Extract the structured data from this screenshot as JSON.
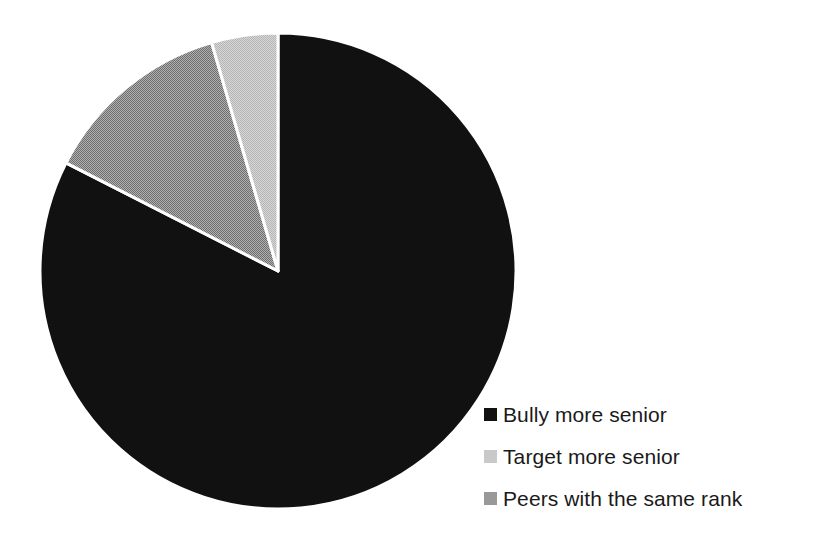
{
  "chart_data": {
    "type": "pie",
    "title": "",
    "subtitle": "",
    "xlabel": "",
    "ylabel": "",
    "grid": false,
    "legend_position": "bottom-right",
    "start_angle_deg": 0,
    "direction": "clockwise",
    "categories": [
      "Bully more senior",
      "Target more senior",
      "Peers with the same rank"
    ],
    "values": [
      82.5,
      4.5,
      13.0
    ],
    "slices": [
      {
        "label": "Bully more senior",
        "value": 82.5,
        "color": "#111111",
        "start_deg": 0,
        "end_deg": 297.0
      },
      {
        "label": "Peers with the same rank",
        "value": 13.0,
        "color": "#999999",
        "start_deg": 297.0,
        "end_deg": 343.8
      },
      {
        "label": "Target more senior",
        "value": 4.5,
        "color": "#c9c9c9",
        "start_deg": 343.8,
        "end_deg": 360.0
      }
    ]
  },
  "legend": {
    "items": [
      {
        "label": "Bully more senior",
        "swatch_color": "#111111",
        "swatch_icon": "square-swatch-icon"
      },
      {
        "label": "Target more senior",
        "swatch_color": "#c9c9c9",
        "swatch_icon": "square-swatch-icon"
      },
      {
        "label": "Peers with the same rank",
        "swatch_color": "#999999",
        "swatch_icon": "square-swatch-icon"
      }
    ]
  },
  "geometry": {
    "center_x": 278,
    "center_y": 271,
    "radius": 238,
    "separator_color": "#ffffff",
    "separator_width": 3
  },
  "colors": {
    "background": "#ffffff",
    "text": "#1a1a1a",
    "slice_dark": "#111111",
    "slice_light_gray": "#c9c9c9",
    "slice_medium_gray": "#999999"
  }
}
